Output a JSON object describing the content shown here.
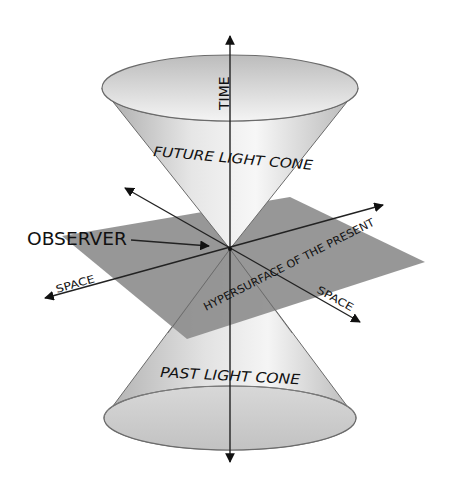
{
  "diagram": {
    "type": "light-cone",
    "labels": {
      "time_axis": "TIME",
      "future_cone": "FUTURE LIGHT CONE",
      "past_cone": "PAST LIGHT CONE",
      "observer": "OBSERVER",
      "space_left": "SPACE",
      "space_right": "SPACE",
      "hypersurface": "HYPERSURFACE OF THE PRESENT"
    },
    "colors": {
      "background": "#ffffff",
      "plane": "#8e8e8e",
      "cone_light": "#f2f2f2",
      "cone_dark": "#bdbdbd",
      "axis": "#222222"
    }
  }
}
